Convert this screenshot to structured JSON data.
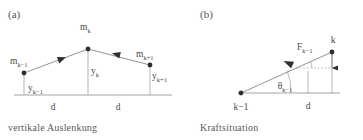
{
  "figure": {
    "background_color": "#ffffff",
    "line_color": "#777777",
    "marker_color": "#2e2e2e",
    "text_color": "#4a4a4a"
  },
  "panel_a": {
    "label": "(a)",
    "caption": "vertikale Auslenkung",
    "masses": [
      {
        "base": "m",
        "sub": "k−1"
      },
      {
        "base": "m",
        "sub": "k"
      },
      {
        "base": "m",
        "sub": "k+1"
      }
    ],
    "displacements": [
      {
        "base": "y",
        "sub": "k−1"
      },
      {
        "base": "y",
        "sub": "k"
      },
      {
        "base": "y",
        "sub": "k+1"
      }
    ],
    "spacings": [
      "d",
      "d"
    ],
    "nodes": [
      {
        "name": "m_k-1",
        "x": 24,
        "y": 73
      },
      {
        "name": "m_k",
        "x": 88,
        "y": 49
      },
      {
        "name": "m_k+1",
        "x": 150,
        "y": 65
      }
    ],
    "baseline_y": 95,
    "arrow_count": 2
  },
  "panel_b": {
    "label": "(b)",
    "caption": "Kraftsituation",
    "node_labels": [
      {
        "base": "k−1",
        "sub": ""
      },
      {
        "base": "k",
        "sub": ""
      }
    ],
    "force": {
      "base": "F",
      "sub": "k−1"
    },
    "angle": {
      "base": "θ",
      "sub": "k−1"
    },
    "spacing": "d",
    "nodes": [
      {
        "name": "k-1",
        "x": 241,
        "y": 93
      },
      {
        "name": "k",
        "x": 332,
        "y": 52
      }
    ],
    "baseline_y": 93,
    "vertical_arrow": {
      "from_y": 54,
      "to_y": 73
    }
  }
}
